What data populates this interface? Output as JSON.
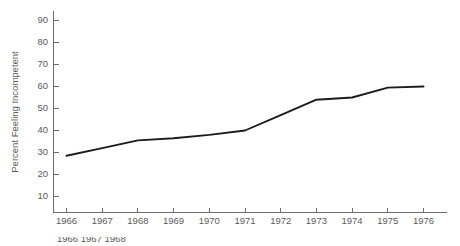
{
  "chart_data": {
    "type": "line",
    "title": "",
    "subtitle": "",
    "xlabel": "",
    "ylabel": "Percent Feeling Incompetent",
    "x": [
      1966,
      1967,
      1968,
      1969,
      1970,
      1971,
      1972,
      1973,
      1974,
      1975,
      1976
    ],
    "xtick_labels": [
      "1966",
      "1967",
      "1968",
      "1969",
      "1970",
      "1971",
      "1972",
      "1973",
      "1974",
      "1975",
      "1976"
    ],
    "ytick_labels": [
      "10",
      "20",
      "30",
      "40",
      "50",
      "60",
      "70",
      "80",
      "90"
    ],
    "ytick_values": [
      10,
      20,
      30,
      40,
      50,
      60,
      70,
      80,
      90
    ],
    "ylim": [
      0,
      95
    ],
    "xlim": [
      1965.5,
      1976.5
    ],
    "grid": false,
    "legend": null,
    "series": [
      {
        "name": "Percent Feeling Incompetent",
        "color": "#1c1c1c",
        "values": [
          28.5,
          32.0,
          35.5,
          36.5,
          38.0,
          40.0,
          47.0,
          54.0,
          55.0,
          59.5,
          60.0
        ]
      }
    ],
    "annotations": []
  },
  "figure": {
    "axis_color": "#6b6b6b",
    "text_color": "#5a5a5a",
    "line_color": "#1c1c1c",
    "background": "#ffffff"
  },
  "caption": {
    "clipped_text": "1966  1967  1968"
  }
}
